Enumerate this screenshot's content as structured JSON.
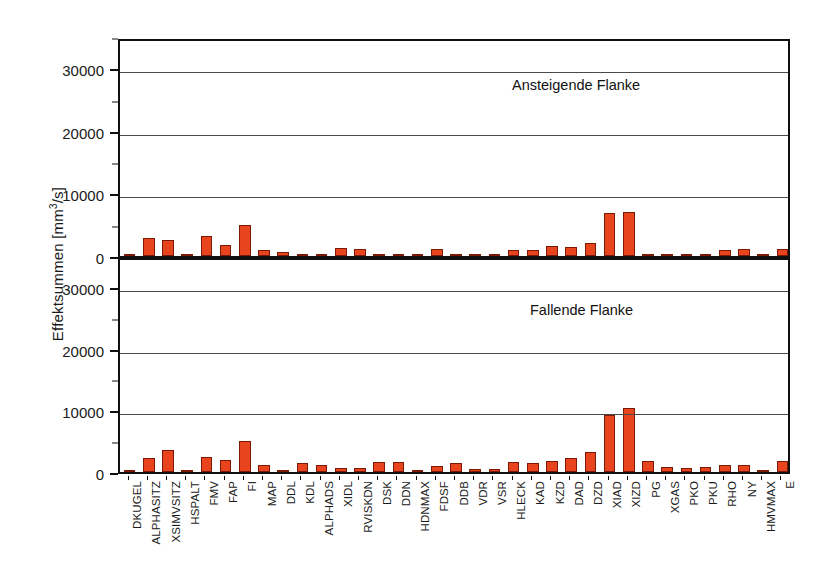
{
  "chart_data": {
    "type": "bar",
    "title": "",
    "xlabel": "",
    "ylabel": "Effektsummen [mm3/s]",
    "ylabel_base": "Effektsummen [mm",
    "ylabel_sup": "3",
    "ylabel_tail": "/s]",
    "grid": true,
    "legend_position": "none",
    "bar_color": "#E8451E",
    "bar_edge_color": "#7A1A06",
    "axis_color": "#101010",
    "ylim": [
      0,
      35000
    ],
    "yticks": [
      0,
      10000,
      20000,
      30000
    ],
    "ytick_labels": [
      "0",
      "10000",
      "20000",
      "30000"
    ],
    "yminor_ticks": [
      5000,
      15000,
      25000,
      35000
    ],
    "categories": [
      "DKUGEL",
      "ALPHASITZ",
      "XSIMVSITZ",
      "HSPALT",
      "FMV",
      "FAP",
      "FI",
      "MAP",
      "DDL",
      "KDL",
      "ALPHADS",
      "XIDL",
      "RVISKDN",
      "DSK",
      "DDN",
      "HDNMAX",
      "FDSF",
      "DDB",
      "VDR",
      "VSR",
      "HLECK",
      "KAD",
      "KZD",
      "DAD",
      "DZD",
      "XIAD",
      "XIZD",
      "PG",
      "XGAS",
      "PKO",
      "PKU",
      "RHO",
      "NY",
      "HMVMAX",
      "E"
    ],
    "series": [
      {
        "name": "Ansteigende Flanke",
        "panel": "top",
        "values": [
          400,
          2850,
          2600,
          400,
          3150,
          1750,
          4950,
          900,
          600,
          150,
          120,
          1350,
          1050,
          200,
          130,
          120,
          1050,
          150,
          120,
          100,
          900,
          1000,
          1650,
          1500,
          2050,
          6800,
          7100,
          150,
          120,
          110,
          100,
          900,
          1200,
          150,
          1200
        ]
      },
      {
        "name": "Fallende Flanke",
        "panel": "bottom",
        "values": [
          220,
          2300,
          3500,
          280,
          2400,
          1900,
          4950,
          1200,
          300,
          1450,
          1150,
          700,
          600,
          1700,
          1650,
          250,
          1050,
          1400,
          550,
          550,
          1700,
          1500,
          1800,
          2300,
          3300,
          9200,
          10400,
          1750,
          750,
          700,
          750,
          1100,
          1200,
          280,
          1800
        ]
      }
    ],
    "annotations": [
      {
        "text": "Ansteigende Flanke",
        "panel": "top"
      },
      {
        "text": "Fallende Flanke",
        "panel": "bottom"
      }
    ]
  },
  "figure": {
    "caption": ""
  }
}
